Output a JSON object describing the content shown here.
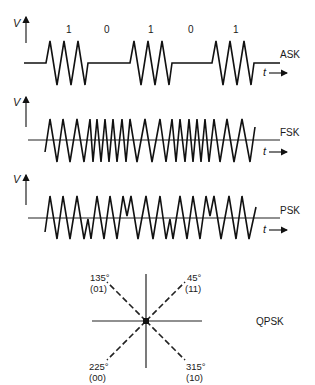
{
  "panels": {
    "ask": {
      "label": "ASK",
      "y_axis_label": "V",
      "x_axis_label": "t",
      "bits": [
        "1",
        "0",
        "1",
        "0",
        "1"
      ]
    },
    "fsk": {
      "label": "FSK",
      "y_axis_label": "V",
      "x_axis_label": "t"
    },
    "psk": {
      "label": "PSK",
      "y_axis_label": "V",
      "x_axis_label": "t"
    },
    "qpsk": {
      "label": "QPSK",
      "points": [
        {
          "angle": "135°",
          "code": "(01)"
        },
        {
          "angle": "45°",
          "code": "(11)"
        },
        {
          "angle": "225°",
          "code": "(00)"
        },
        {
          "angle": "315°",
          "code": "(10)"
        }
      ]
    }
  },
  "colors": {
    "ink": "#111111",
    "background": "#ffffff"
  }
}
